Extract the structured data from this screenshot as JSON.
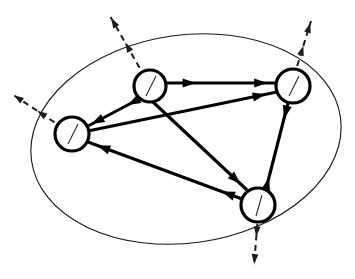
{
  "figure": {
    "type": "node-link-diagram",
    "background_color": "#ffffff",
    "line_color": "#000000",
    "boundary_color": "#1a1a1a",
    "dashed_color": "#1d1d1d",
    "canvas": {
      "width": 355,
      "height": 279
    }
  },
  "boundary": {
    "shape": "ellipse",
    "label": "system-boundary",
    "center_x": 186,
    "center_y": 139,
    "radius_x": 156,
    "radius_y": 104,
    "rotation_deg": -8,
    "stroke_width": 1.15
  },
  "nodes": [
    {
      "id": "n-top-left",
      "name": "node-top-left",
      "label": "",
      "cx": 150,
      "cy": 86,
      "r": 16,
      "tick": {
        "x1": 156,
        "y1": 76,
        "x2": 146,
        "y2": 96
      }
    },
    {
      "id": "n-top-right",
      "name": "node-top-right",
      "label": "",
      "cx": 293,
      "cy": 86,
      "r": 17,
      "tick": {
        "x1": 299,
        "y1": 76,
        "x2": 289,
        "y2": 96
      }
    },
    {
      "id": "n-left",
      "name": "node-left",
      "label": "",
      "cx": 72,
      "cy": 134,
      "r": 17,
      "tick": {
        "x1": 78,
        "y1": 124,
        "x2": 68,
        "y2": 144
      }
    },
    {
      "id": "n-bottom",
      "name": "node-bottom",
      "label": "",
      "cx": 258,
      "cy": 205,
      "r": 17,
      "tick": {
        "x1": 262,
        "y1": 195,
        "x2": 256,
        "y2": 216
      }
    }
  ],
  "edges": [
    {
      "id": "e-tl-tr",
      "name": "edge-top-left-to-top-right",
      "from": "n-top-left",
      "to": "n-top-right",
      "x1": 166,
      "y1": 83,
      "x2": 276,
      "y2": 83,
      "heads": [
        {
          "t": 0.27,
          "dir": "forward"
        },
        {
          "t": 0.92,
          "dir": "forward"
        }
      ]
    },
    {
      "id": "e-left-tr",
      "name": "edge-left-to-top-right",
      "from": "n-left",
      "to": "n-top-right",
      "x1": 88,
      "y1": 131,
      "x2": 277,
      "y2": 92,
      "heads": [
        {
          "t": 0.94,
          "dir": "forward"
        }
      ]
    },
    {
      "id": "e-tl-left",
      "name": "edge-top-left-to-left",
      "from": "n-top-left",
      "to": "n-left",
      "x1": 139,
      "y1": 99,
      "x2": 88,
      "y2": 126,
      "heads": [
        {
          "t": 0.22,
          "dir": "forward"
        },
        {
          "t": 0.93,
          "dir": "forward"
        }
      ]
    },
    {
      "id": "e-tl-bottom",
      "name": "edge-top-left-to-bottom",
      "from": "n-top-left",
      "to": "n-bottom",
      "x1": 153,
      "y1": 102,
      "x2": 247,
      "y2": 190,
      "heads": [
        {
          "t": 0.93,
          "dir": "forward"
        }
      ]
    },
    {
      "id": "e-bottom-left",
      "name": "edge-bottom-to-left",
      "from": "n-bottom",
      "to": "n-left",
      "x1": 242,
      "y1": 199,
      "x2": 88,
      "y2": 142,
      "heads": [
        {
          "t": 0.13,
          "dir": "forward"
        },
        {
          "t": 0.94,
          "dir": "forward"
        }
      ]
    },
    {
      "id": "e-tr-bottom",
      "name": "edge-top-right-to-bottom-bidirectional",
      "from": "n-top-right",
      "to": "n-bottom",
      "x1": 288,
      "y1": 103,
      "x2": 266,
      "y2": 189,
      "heads": [
        {
          "t": 0.18,
          "dir": "forward"
        },
        {
          "t": 0.87,
          "dir": "backward"
        }
      ]
    }
  ],
  "external_flows": [
    {
      "id": "x-top-left",
      "name": "external-arrow-top-left",
      "node": "n-top-left",
      "x1": 150,
      "y1": 86,
      "x2": 110,
      "y2": 16,
      "heads": [
        {
          "t": 0.62,
          "dir": "forward"
        },
        {
          "t": 0.97,
          "dir": "forward"
        }
      ]
    },
    {
      "id": "x-left",
      "name": "external-arrow-left",
      "node": "n-left",
      "x1": 72,
      "y1": 134,
      "x2": 12,
      "y2": 94,
      "heads": [
        {
          "t": 0.58,
          "dir": "forward"
        },
        {
          "t": 0.97,
          "dir": "forward"
        }
      ]
    },
    {
      "id": "x-top-right",
      "name": "external-arrow-top-right",
      "node": "n-top-right",
      "x1": 291,
      "y1": 86,
      "x2": 311,
      "y2": 21,
      "heads": [
        {
          "t": 0.62,
          "dir": "forward"
        },
        {
          "t": 0.97,
          "dir": "forward"
        }
      ]
    },
    {
      "id": "x-bottom",
      "name": "external-arrow-bottom",
      "node": "n-bottom",
      "x1": 259,
      "y1": 203,
      "x2": 254,
      "y2": 266,
      "heads": [
        {
          "t": 0.53,
          "dir": "forward"
        },
        {
          "t": 0.97,
          "dir": "forward"
        }
      ]
    }
  ]
}
